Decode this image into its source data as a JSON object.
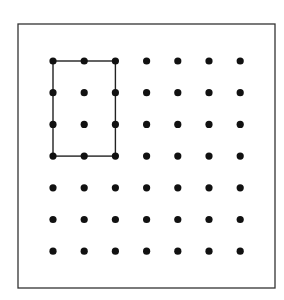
{
  "diagram": {
    "type": "geoboard",
    "frame": {
      "x": 18,
      "y": 24,
      "width": 257,
      "height": 264
    },
    "grid": {
      "rows": 7,
      "cols": 7,
      "origin_x": 53,
      "origin_y": 61,
      "spacing_x": 31.2,
      "spacing_y": 31.7,
      "dot_radius": 3.6
    },
    "shape": {
      "name": "rectangle",
      "from": {
        "col": 0,
        "row": 0
      },
      "to": {
        "col": 2,
        "row": 3
      }
    },
    "colors": {
      "dot": "#111111",
      "line": "#222222",
      "frame": "#333333",
      "background": "#ffffff"
    }
  }
}
